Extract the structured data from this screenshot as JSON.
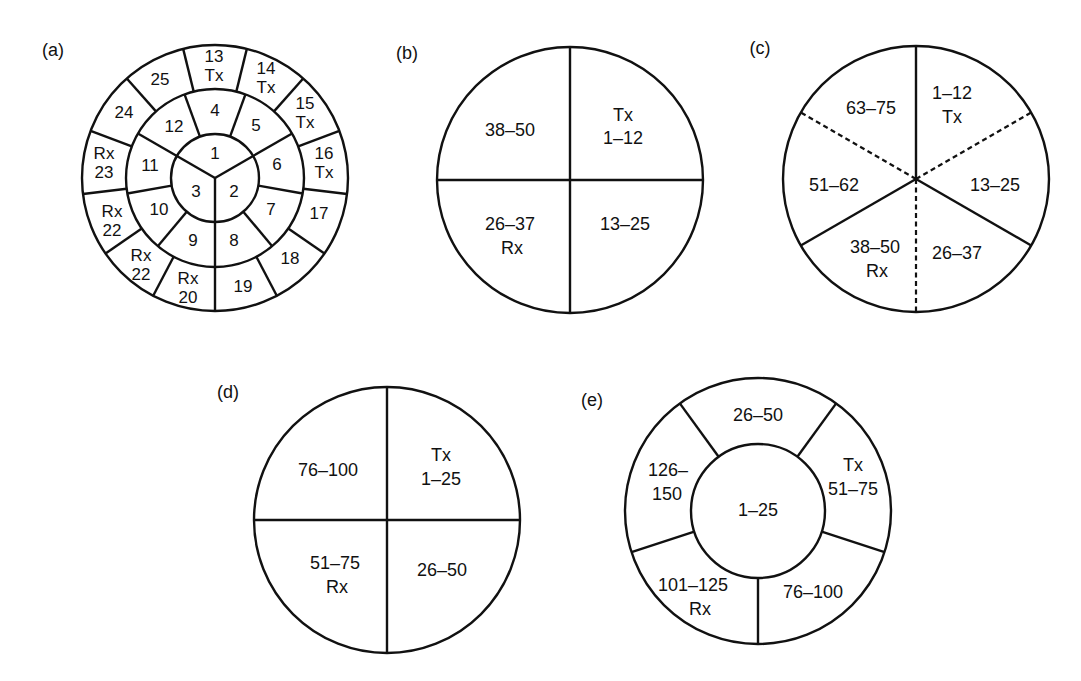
{
  "diagrams": {
    "a": {
      "tag": "(a)",
      "inner": [
        {
          "label": "1"
        },
        {
          "label": "2"
        },
        {
          "label": "3"
        }
      ],
      "middle": [
        {
          "label": "4"
        },
        {
          "label": "5"
        },
        {
          "label": "6"
        },
        {
          "label": "7"
        },
        {
          "label": "8"
        },
        {
          "label": "9"
        },
        {
          "label": "10"
        },
        {
          "label": "11"
        },
        {
          "label": "12"
        }
      ],
      "outer": [
        {
          "num": "13",
          "role": "Tx"
        },
        {
          "num": "14",
          "role": "Tx"
        },
        {
          "num": "15",
          "role": "Tx"
        },
        {
          "num": "16",
          "role": "Tx"
        },
        {
          "num": "17",
          "role": ""
        },
        {
          "num": "18",
          "role": ""
        },
        {
          "num": "19",
          "role": ""
        },
        {
          "num": "20",
          "role": "Rx"
        },
        {
          "num": "21",
          "role": "Rx"
        },
        {
          "num": "22",
          "role": "Rx"
        },
        {
          "num": "23",
          "role": "Rx"
        },
        {
          "num": "24",
          "role": ""
        },
        {
          "num": "25",
          "role": ""
        }
      ]
    },
    "b": {
      "tag": "(b)",
      "sectors": [
        {
          "line1": "38–50",
          "line2": ""
        },
        {
          "line1": "Tx",
          "line2": "1–12"
        },
        {
          "line1": "26–37",
          "line2": "Rx"
        },
        {
          "line1": "13–25",
          "line2": ""
        }
      ]
    },
    "c": {
      "tag": "(c)",
      "sectors": [
        {
          "line1": "1–12",
          "line2": "Tx"
        },
        {
          "line1": "13–25",
          "line2": ""
        },
        {
          "line1": "26–37",
          "line2": ""
        },
        {
          "line1": "38–50",
          "line2": "Rx"
        },
        {
          "line1": "51–62",
          "line2": ""
        },
        {
          "line1": "63–75",
          "line2": ""
        }
      ]
    },
    "d": {
      "tag": "(d)",
      "sectors": [
        {
          "line1": "76–100",
          "line2": ""
        },
        {
          "line1": "Tx",
          "line2": "1–25"
        },
        {
          "line1": "51–75",
          "line2": "Rx"
        },
        {
          "line1": "26–50",
          "line2": ""
        }
      ]
    },
    "e": {
      "tag": "(e)",
      "center": {
        "line1": "1–25"
      },
      "sectors": [
        {
          "line1": "26–50",
          "line2": ""
        },
        {
          "line1": "Tx",
          "line2": "51–75"
        },
        {
          "line1": "76–100",
          "line2": ""
        },
        {
          "line1": "101–125",
          "line2": "Rx"
        },
        {
          "line1": "126–",
          "line2": "150"
        }
      ]
    }
  },
  "colors": {
    "stroke": "#111111",
    "background": "#ffffff"
  }
}
